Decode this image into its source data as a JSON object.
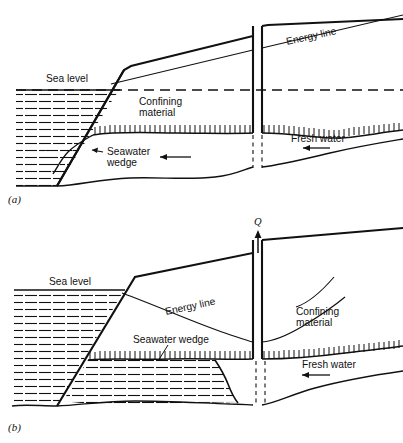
{
  "figure": {
    "type": "hydrogeology-cross-section",
    "ink_color": "#111111",
    "background_color": "#ffffff"
  },
  "panel_a": {
    "caption": "(a)",
    "labels": {
      "sea_level": "Sea level",
      "confining_material_line1": "Confining",
      "confining_material_line2": "material",
      "energy_line": "Energy line",
      "seawater_wedge_line1": "Seawater",
      "seawater_wedge_line2": "wedge",
      "fresh_water": "Fresh water"
    },
    "features": {
      "sea_level_line_style": "dashed",
      "flow_arrows": 2,
      "flow_direction": "leftward, toward the sea",
      "well_pumping": false
    }
  },
  "panel_b": {
    "caption": "(b)",
    "labels": {
      "sea_level": "Sea level",
      "energy_line": "Energy line",
      "seawater_wedge": "Seawater wedge",
      "confining_material_line1": "Confining",
      "confining_material_line2": "material",
      "fresh_water": "Fresh water",
      "discharge": "Q"
    },
    "features": {
      "sea_level_line_style": "solid",
      "flow_arrows": 1,
      "flow_direction": "leftward, toward the well",
      "well_pumping": true,
      "upconing": "seawater wedge rises as a cone toward the pumping well"
    }
  }
}
